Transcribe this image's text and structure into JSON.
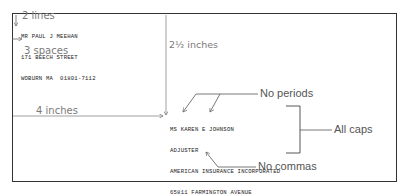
{
  "return_address": {
    "lines": [
      "MR PAUL J MEEHAN",
      "171 BEECH STREET",
      "WOBURN MA  01801-7112"
    ]
  },
  "recipient_address": {
    "lines": [
      "MS KAREN E JOHNSON",
      "ADJUSTER",
      "AMERICAN INSURANCE INCORPORATED",
      "65811 FARMINGTON AVENUE",
      "HARTFORD CT  06156-3716"
    ]
  },
  "annotations": {
    "two_lines": "2 lines",
    "three_spaces": "3 spaces",
    "two_half_inches": "2½ inches",
    "four_inches": "4 inches"
  },
  "callouts": {
    "no_periods": "No periods",
    "all_caps": "All caps",
    "no_commas": "No commas"
  }
}
